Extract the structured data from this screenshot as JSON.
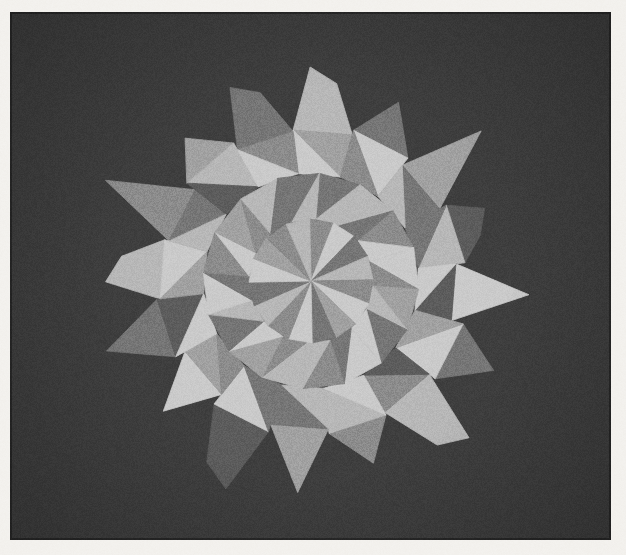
{
  "artwork": {
    "title": "Radial Star Mandala",
    "medium": "geometric facet composition",
    "palette_name": "grayscale",
    "background_color": "#3a3a3a",
    "paper_color": "#f2f0ec",
    "border": {
      "left": 10,
      "top": 12,
      "right": 611,
      "bottom": 540
    },
    "center": {
      "x": 311,
      "y": 281
    },
    "spoke_count": 16,
    "rings": [
      {
        "name": "inner-core",
        "radius": 62
      },
      {
        "name": "mid-ring",
        "radius": 108
      },
      {
        "name": "outer-disc",
        "radius": 152
      },
      {
        "name": "spike-tips",
        "radius": 214
      }
    ],
    "tones": {
      "darkest": "#3a3a3a",
      "dark": "#565656",
      "mid_dark": "#6e6e6e",
      "mid": "#838383",
      "mid_light": "#9a9a9a",
      "light": "#b2b2b2",
      "lightest": "#c6c6c6"
    },
    "chart_data": {
      "type": "pie",
      "title": "Radial Star Mandala",
      "xlabel": "",
      "ylabel": "",
      "categories": [
        "spoke-01",
        "spoke-02",
        "spoke-03",
        "spoke-04",
        "spoke-05",
        "spoke-06",
        "spoke-07",
        "spoke-08",
        "spoke-09",
        "spoke-10",
        "spoke-11",
        "spoke-12",
        "spoke-13",
        "spoke-14",
        "spoke-15",
        "spoke-16"
      ],
      "values": [
        22.5,
        22.5,
        22.5,
        22.5,
        22.5,
        22.5,
        22.5,
        22.5,
        22.5,
        22.5,
        22.5,
        22.5,
        22.5,
        22.5,
        22.5,
        22.5
      ],
      "legend_position": "none",
      "grid": false,
      "series": [
        {
          "name": "spike-ring",
          "values": [
            "#b2b2b2",
            "#6e6e6e",
            "#9a9a9a",
            "#565656",
            "#c6c6c6",
            "#6e6e6e",
            "#b2b2b2",
            "#838383",
            "#9a9a9a",
            "#565656",
            "#c6c6c6",
            "#6e6e6e",
            "#b2b2b2",
            "#838383",
            "#9a9a9a",
            "#6e6e6e"
          ]
        },
        {
          "name": "outer-disc-a",
          "values": [
            "#9a9a9a",
            "#c6c6c6",
            "#6e6e6e",
            "#b2b2b2",
            "#565656",
            "#c6c6c6",
            "#838383",
            "#b2b2b2",
            "#6e6e6e",
            "#c6c6c6",
            "#9a9a9a",
            "#565656",
            "#c6c6c6",
            "#6e6e6e",
            "#b2b2b2",
            "#838383"
          ]
        },
        {
          "name": "outer-disc-b",
          "values": [
            "#c6c6c6",
            "#838383",
            "#b2b2b2",
            "#6e6e6e",
            "#c6c6c6",
            "#9a9a9a",
            "#565656",
            "#c6c6c6",
            "#b2b2b2",
            "#6e6e6e",
            "#838383",
            "#c6c6c6",
            "#9a9a9a",
            "#b2b2b2",
            "#565656",
            "#c6c6c6"
          ]
        },
        {
          "name": "mid-ring-a",
          "values": [
            "#6e6e6e",
            "#b2b2b2",
            "#838383",
            "#c6c6c6",
            "#9a9a9a",
            "#6e6e6e",
            "#c6c6c6",
            "#838383",
            "#b2b2b2",
            "#9a9a9a",
            "#6e6e6e",
            "#c6c6c6",
            "#838383",
            "#9a9a9a",
            "#b2b2b2",
            "#6e6e6e"
          ]
        },
        {
          "name": "mid-ring-b",
          "values": [
            "#b2b2b2",
            "#6e6e6e",
            "#c6c6c6",
            "#838383",
            "#b2b2b2",
            "#c6c6c6",
            "#6e6e6e",
            "#b2b2b2",
            "#838383",
            "#c6c6c6",
            "#b2b2b2",
            "#6e6e6e",
            "#c6c6c6",
            "#838383",
            "#6e6e6e",
            "#b2b2b2"
          ]
        },
        {
          "name": "core",
          "values": [
            "#838383",
            "#c6c6c6",
            "#6e6e6e",
            "#b2b2b2",
            "#838383",
            "#c6c6c6",
            "#9a9a9a",
            "#6e6e6e",
            "#c6c6c6",
            "#838383",
            "#b2b2b2",
            "#6e6e6e",
            "#c6c6c6",
            "#9a9a9a",
            "#838383",
            "#b2b2b2"
          ]
        }
      ]
    }
  }
}
